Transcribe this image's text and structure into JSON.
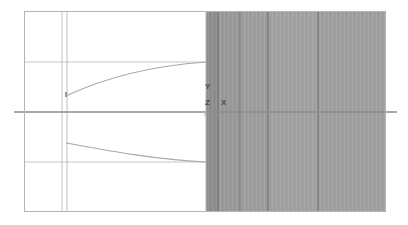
{
  "drawing": {
    "title": "Sectional elevation drawing",
    "background_color": "#ffffff",
    "frame": {
      "stroke": "#b4b4b4",
      "x": 24,
      "y": 11,
      "width": 362,
      "height": 201
    },
    "labels": {
      "y_axis": "Y",
      "z_axis": "Z",
      "x_axis": "X",
      "dimension_row": "PNT  DX    DY"
    },
    "label_color": "#4a4a4a",
    "dimension_color": "#9a9a9a",
    "centerline": {
      "y": 112,
      "x_start": 14,
      "x_end": 397,
      "stroke": "#8d8d8d",
      "width": 1.6
    },
    "guide_lines": {
      "stroke": "#c0c0c0",
      "vertical_x": [
        62,
        67
      ],
      "horizontal_y": [
        62,
        162
      ]
    },
    "curves": {
      "stroke": "#a8a8a8",
      "upper": {
        "start_x": 66,
        "start_y": 96,
        "end_x": 206,
        "end_y": 62,
        "stub_top_y": 92
      },
      "lower": {
        "start_x": 66,
        "start_y": 143,
        "end_x": 206,
        "end_y": 162
      }
    },
    "shaded_panel": {
      "x": 206,
      "y": 12,
      "width": 180,
      "height": 199,
      "band_colors": [
        "#8e8e8e",
        "#9a9a9a",
        "#9e9e9e",
        "#a2a2a2",
        "#a0a0a0"
      ],
      "divider_stroke": "#6f6f6f",
      "divider_x": [
        218,
        240,
        268,
        318
      ]
    }
  }
}
